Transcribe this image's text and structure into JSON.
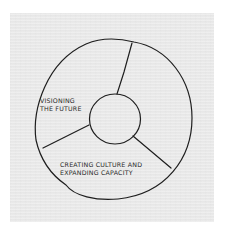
{
  "diagram": {
    "type": "ring-diagram",
    "segments": 3,
    "labels": {
      "vision": [
        "VISIONING",
        "THE FUTURE"
      ],
      "culture": [
        "CREATING CULTURE AND",
        "EXPANDING CAPACITY"
      ]
    },
    "colors": {
      "paper": "#e9e9e9",
      "ink": "#1e1e1e",
      "background": "#ffffff"
    }
  }
}
